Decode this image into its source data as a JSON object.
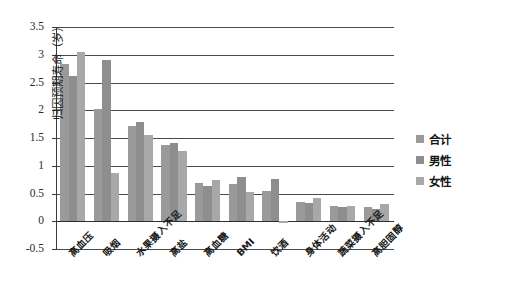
{
  "chart_data": {
    "type": "bar",
    "title": "",
    "xlabel": "",
    "ylabel": "归因预期寿命（岁）",
    "ylim": [
      -0.5,
      3.5
    ],
    "ytick_labels": [
      "3.5",
      "3",
      "2.5",
      "2",
      "1.5",
      "1",
      "0.5",
      "0",
      "-0.5"
    ],
    "ytick_values": [
      3.5,
      3,
      2.5,
      2,
      1.5,
      1,
      0.5,
      0,
      -0.5
    ],
    "grid": true,
    "legend_position": "right",
    "categories": [
      "高血压",
      "吸烟",
      "水果摄入不足",
      "高盐",
      "高血糖",
      "BMI",
      "饮酒",
      "身体活动",
      "蔬菜摄入不足",
      "高胆固醇"
    ],
    "series": [
      {
        "name": "合计",
        "color": "#9a9a9a",
        "values": [
          2.83,
          2.03,
          1.72,
          1.37,
          0.69,
          0.68,
          0.55,
          0.35,
          0.27,
          0.26
        ]
      },
      {
        "name": "男性",
        "color": "#8e8e8e",
        "values": [
          2.62,
          2.9,
          1.79,
          1.41,
          0.64,
          0.79,
          0.77,
          0.33,
          0.26,
          0.23
        ]
      },
      {
        "name": "女性",
        "color": "#a8a8a8",
        "values": [
          3.05,
          0.87,
          1.55,
          1.27,
          0.75,
          0.53,
          -0.03,
          0.42,
          0.28,
          0.31
        ]
      }
    ]
  },
  "legend": {
    "items": [
      {
        "label": "合计"
      },
      {
        "label": "男性"
      },
      {
        "label": "女性"
      }
    ]
  }
}
